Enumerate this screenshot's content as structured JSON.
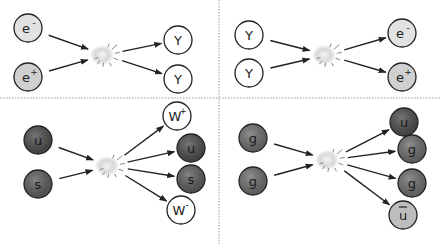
{
  "colors": {
    "electron": "#e2e2e2",
    "positron": "#d0d0d0",
    "photon": "#ffffff",
    "quark_u": "#4a4a4a",
    "quark_s": "#5a5a5a",
    "gluon": "#6a6a6a",
    "antiquark": "#bdbdbd",
    "w_boson": "#ffffff",
    "outline": "#222222",
    "divider": "#999999"
  },
  "panels": [
    {
      "name": "electron-positron-annihilation",
      "inputs": [
        {
          "label": "e",
          "sup": "-",
          "kind": "electron",
          "x": 28,
          "y": 28
        },
        {
          "label": "e",
          "sup": "+",
          "kind": "positron",
          "x": 28,
          "y": 77
        }
      ],
      "collision": {
        "x": 105,
        "y": 55
      },
      "outputs": [
        {
          "label": "Y",
          "sup": "",
          "kind": "photon",
          "x": 178,
          "y": 40
        },
        {
          "label": "Y",
          "sup": "",
          "kind": "photon",
          "x": 178,
          "y": 79
        }
      ]
    },
    {
      "name": "photon-pair-production",
      "inputs": [
        {
          "label": "Y",
          "sup": "",
          "kind": "photon",
          "x": 249,
          "y": 35
        },
        {
          "label": "Y",
          "sup": "",
          "kind": "photon",
          "x": 249,
          "y": 73
        }
      ],
      "collision": {
        "x": 327,
        "y": 55
      },
      "outputs": [
        {
          "label": "e",
          "sup": "-",
          "kind": "electron",
          "x": 402,
          "y": 33
        },
        {
          "label": "e",
          "sup": "+",
          "kind": "positron",
          "x": 402,
          "y": 77
        }
      ]
    },
    {
      "name": "quark-w-production",
      "inputs": [
        {
          "label": "u",
          "sup": "",
          "kind": "quark_u",
          "x": 38,
          "y": 140
        },
        {
          "label": "s",
          "sup": "",
          "kind": "quark_s",
          "x": 38,
          "y": 184
        }
      ],
      "collision": {
        "x": 110,
        "y": 166
      },
      "outputs": [
        {
          "label": "W",
          "sup": "+",
          "kind": "w_boson",
          "x": 177,
          "y": 116
        },
        {
          "label": "u",
          "sup": "",
          "kind": "quark_u",
          "x": 191,
          "y": 148
        },
        {
          "label": "s",
          "sup": "",
          "kind": "quark_s",
          "x": 191,
          "y": 179
        },
        {
          "label": "W",
          "sup": "-",
          "kind": "w_boson",
          "x": 181,
          "y": 210
        }
      ]
    },
    {
      "name": "gluon-fusion",
      "inputs": [
        {
          "label": "g",
          "sup": "",
          "kind": "gluon",
          "x": 253,
          "y": 138
        },
        {
          "label": "g",
          "sup": "",
          "kind": "gluon",
          "x": 253,
          "y": 181
        }
      ],
      "collision": {
        "x": 330,
        "y": 160
      },
      "outputs": [
        {
          "label": "u",
          "sup": "",
          "kind": "quark_u",
          "x": 404,
          "y": 122
        },
        {
          "label": "g",
          "sup": "",
          "kind": "gluon",
          "x": 412,
          "y": 149
        },
        {
          "label": "g",
          "sup": "",
          "kind": "gluon",
          "x": 412,
          "y": 183
        },
        {
          "label": "u",
          "sup": "",
          "bar": true,
          "kind": "antiquark",
          "x": 403,
          "y": 215
        }
      ]
    }
  ]
}
